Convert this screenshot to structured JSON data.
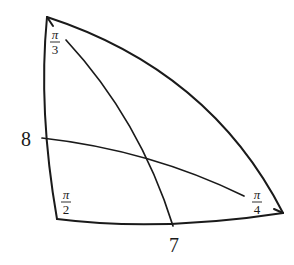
{
  "diagram": {
    "type": "spherical-triangle",
    "vertices": {
      "top": {
        "angle_label_num": "π",
        "angle_label_den": "3"
      },
      "bottom_left": {
        "angle_label_num": "π",
        "angle_label_den": "2"
      },
      "right": {
        "angle_label_num": "π",
        "angle_label_den": "4"
      }
    },
    "side_labels": {
      "left": "8",
      "bottom": "7"
    },
    "stroke_color": "#1a1a1a",
    "background": "#ffffff"
  }
}
